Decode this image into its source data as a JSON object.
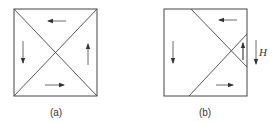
{
  "figure": {
    "panels": [
      {
        "id": "a",
        "caption": "(a)",
        "description": "Square divided by both diagonals into four triangular domains; arrows circulate counter-clockwise (top: left, left: down, bottom: right, right: up)",
        "arrows": [
          "left",
          "down",
          "right",
          "up"
        ]
      },
      {
        "id": "b",
        "caption": "(b)",
        "description": "Square with shifted domain walls; a small triangular domain on the right side with upward magnetization, applied field H pointing down",
        "arrows": [
          "left",
          "down",
          "right",
          "up"
        ],
        "field_label": "H",
        "field_direction": "down"
      }
    ],
    "colors": {
      "line": "#444444",
      "background": "#ffffff"
    }
  }
}
